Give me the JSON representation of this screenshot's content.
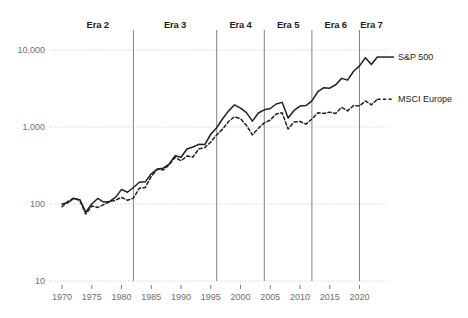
{
  "chart_data": {
    "type": "line",
    "title": "",
    "subtitle": "",
    "xlabel": "",
    "ylabel": "",
    "yscale": "log",
    "ylim": [
      10,
      10000
    ],
    "xlim": [
      1969,
      2024
    ],
    "grid": true,
    "legend_position": "right",
    "y_ticks": [
      {
        "value": 10,
        "label": "10"
      },
      {
        "value": 100,
        "label": "100"
      },
      {
        "value": 1000,
        "label": "1,000"
      },
      {
        "value": 10000,
        "label": "10,000"
      }
    ],
    "x_ticks": [
      {
        "value": 1970,
        "label": "1970"
      },
      {
        "value": 1975,
        "label": "1975"
      },
      {
        "value": 1980,
        "label": "1980"
      },
      {
        "value": 1985,
        "label": "1985"
      },
      {
        "value": 1990,
        "label": "1990"
      },
      {
        "value": 1995,
        "label": "1995"
      },
      {
        "value": 2000,
        "label": "2000"
      },
      {
        "value": 2005,
        "label": "2005"
      },
      {
        "value": 2010,
        "label": "2010"
      },
      {
        "value": 2015,
        "label": "2015"
      },
      {
        "value": 2020,
        "label": "2020"
      }
    ],
    "era_dividers": [
      1982,
      1996,
      2004,
      2012,
      2020
    ],
    "era_labels": [
      {
        "label": "Era 2",
        "center": 1976.0
      },
      {
        "label": "Era 3",
        "center": 1989.0
      },
      {
        "label": "Era 4",
        "center": 2000.0
      },
      {
        "label": "Era 5",
        "center": 2008.0
      },
      {
        "label": "Era 6",
        "center": 2016.0
      },
      {
        "label": "Era 7",
        "center": 2022.0
      }
    ],
    "series": [
      {
        "name": "S&P 500",
        "style": "solid",
        "color": "#231f20",
        "x": [
          1970,
          1971,
          1972,
          1973,
          1974,
          1975,
          1976,
          1977,
          1978,
          1979,
          1980,
          1981,
          1982,
          1983,
          1984,
          1985,
          1986,
          1987,
          1988,
          1989,
          1990,
          1991,
          1992,
          1993,
          1994,
          1995,
          1996,
          1997,
          1998,
          1999,
          2000,
          2001,
          2002,
          2003,
          2004,
          2005,
          2006,
          2007,
          2008,
          2009,
          2010,
          2011,
          2012,
          2013,
          2014,
          2015,
          2016,
          2017,
          2018,
          2019,
          2020,
          2021,
          2022,
          2023
        ],
        "values": [
          100,
          104,
          118,
          114,
          78,
          100,
          118,
          106,
          108,
          122,
          155,
          142,
          164,
          192,
          194,
          247,
          284,
          292,
          330,
          424,
          404,
          518,
          549,
          595,
          592,
          805,
          977,
          1280,
          1620,
          1940,
          1760,
          1540,
          1190,
          1520,
          1670,
          1740,
          1990,
          2090,
          1310,
          1640,
          1870,
          1900,
          2180,
          2870,
          3240,
          3190,
          3540,
          4280,
          4060,
          5290,
          6210,
          7940,
          6470,
          8100
        ],
        "note": "Index rebased to 100 at 1970, plotted on log scale"
      },
      {
        "name": "MSCI Europe",
        "style": "dashed",
        "color": "#231f20",
        "x": [
          1970,
          1971,
          1972,
          1973,
          1974,
          1975,
          1976,
          1977,
          1978,
          1979,
          1980,
          1981,
          1982,
          1983,
          1984,
          1985,
          1986,
          1987,
          1988,
          1989,
          1990,
          1991,
          1992,
          1993,
          1994,
          1995,
          1996,
          1997,
          1998,
          1999,
          2000,
          2001,
          2002,
          2003,
          2004,
          2005,
          2006,
          2007,
          2008,
          2009,
          2010,
          2011,
          2012,
          2013,
          2014,
          2015,
          2016,
          2017,
          2018,
          2019,
          2020,
          2021,
          2022,
          2023
        ],
        "values": [
          92,
          108,
          120,
          110,
          74,
          94,
          90,
          98,
          107,
          112,
          122,
          112,
          119,
          160,
          164,
          228,
          281,
          276,
          322,
          404,
          364,
          420,
          406,
          520,
          540,
          640,
          790,
          940,
          1180,
          1360,
          1280,
          1050,
          790,
          960,
          1130,
          1230,
          1480,
          1530,
          940,
          1160,
          1180,
          1090,
          1270,
          1530,
          1500,
          1560,
          1500,
          1800,
          1620,
          1900,
          1880,
          2180,
          1940,
          2300
        ],
        "note": "Index rebased to 100 at 1970, plotted on log scale"
      }
    ]
  },
  "legend": {
    "entries": [
      {
        "label": "S&P 500",
        "style": "solid"
      },
      {
        "label": "MSCI Europe",
        "style": "dashed"
      }
    ]
  }
}
